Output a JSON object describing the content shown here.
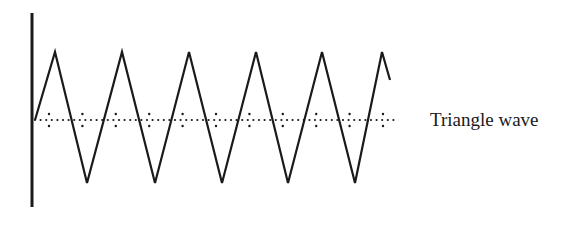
{
  "diagram": {
    "label": "Triangle wave",
    "stroke_color": "#1a1a1a",
    "axis": {
      "x": 32,
      "y_top": 13,
      "y_bottom": 207
    },
    "baseline_y": 120,
    "baseline_x_start": 35,
    "baseline_x_end": 398,
    "tick_spacing": 33.4,
    "tick_first_x": 49,
    "wave_points": [
      [
        35,
        120
      ],
      [
        55,
        52
      ],
      [
        87,
        183
      ],
      [
        122,
        52
      ],
      [
        155,
        183
      ],
      [
        189,
        52
      ],
      [
        222,
        183
      ],
      [
        256,
        52
      ],
      [
        288,
        183
      ],
      [
        322,
        52
      ],
      [
        355,
        183
      ],
      [
        382,
        52
      ],
      [
        390,
        80
      ]
    ]
  }
}
